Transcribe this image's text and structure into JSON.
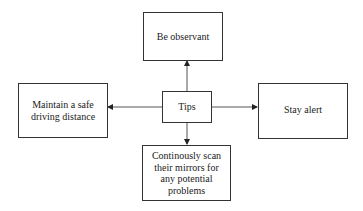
{
  "diagram": {
    "center": {
      "label": "Tips"
    },
    "nodes": {
      "top": {
        "label": "Be observant"
      },
      "left": {
        "label": "Maintain a safe driving distance"
      },
      "right": {
        "label": "Stay alert"
      },
      "bottom": {
        "label": "Continously scan their mirrors for any potential problems"
      }
    },
    "edges": [
      {
        "from": "Tips",
        "to": "Be observant"
      },
      {
        "from": "Tips",
        "to": "Maintain a safe driving distance"
      },
      {
        "from": "Tips",
        "to": "Stay alert"
      },
      {
        "from": "Tips",
        "to": "Continously scan their mirrors for any potential problems"
      }
    ]
  }
}
